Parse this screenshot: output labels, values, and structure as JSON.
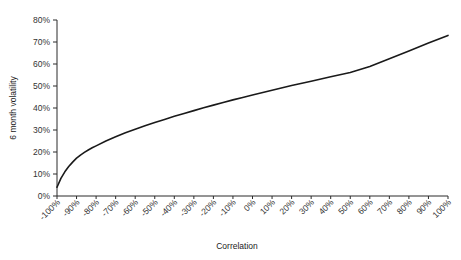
{
  "chart_data": {
    "type": "line",
    "title": "",
    "subtitle": "",
    "xlabel": "Correlation",
    "ylabel": "6 month volatility",
    "xlim": [
      -100,
      100
    ],
    "ylim": [
      0,
      80
    ],
    "grid": false,
    "legend": false,
    "x_tick_labels": [
      "-100%",
      "-90%",
      "-80%",
      "-70%",
      "-60%",
      "-50%",
      "-40%",
      "-30%",
      "-20%",
      "-10%",
      "0%",
      "10%",
      "20%",
      "30%",
      "40%",
      "50%",
      "60%",
      "70%",
      "80%",
      "90%",
      "100%"
    ],
    "x_tick_values": [
      -100,
      -90,
      -80,
      -70,
      -60,
      -50,
      -40,
      -30,
      -20,
      -10,
      0,
      10,
      20,
      30,
      40,
      50,
      60,
      70,
      80,
      90,
      100
    ],
    "y_tick_labels": [
      "0%",
      "10%",
      "20%",
      "30%",
      "40%",
      "50%",
      "60%",
      "70%",
      "80%"
    ],
    "y_tick_values": [
      0,
      10,
      20,
      30,
      40,
      50,
      60,
      70,
      80
    ],
    "series": [
      {
        "name": "6 month volatility",
        "color": "#1a1a1a",
        "x": [
          -100,
          -98,
          -96,
          -94,
          -92,
          -90,
          -88,
          -86,
          -84,
          -82,
          -80,
          -75,
          -70,
          -65,
          -60,
          -55,
          -50,
          -45,
          -40,
          -35,
          -30,
          -25,
          -20,
          -15,
          -10,
          -5,
          0,
          10,
          20,
          30,
          40,
          50,
          60,
          70,
          80,
          90,
          100
        ],
        "y": [
          4.0,
          8.0,
          11.0,
          13.4,
          15.4,
          17.2,
          18.6,
          19.8,
          20.9,
          21.9,
          22.8,
          25.0,
          26.9,
          28.7,
          30.3,
          31.9,
          33.4,
          34.8,
          36.2,
          37.5,
          38.8,
          40.1,
          41.3,
          42.5,
          43.7,
          44.8,
          45.9,
          48.1,
          50.2,
          52.2,
          54.2,
          56.1,
          58.9,
          62.4,
          65.9,
          69.5,
          73.0
        ]
      }
    ]
  }
}
